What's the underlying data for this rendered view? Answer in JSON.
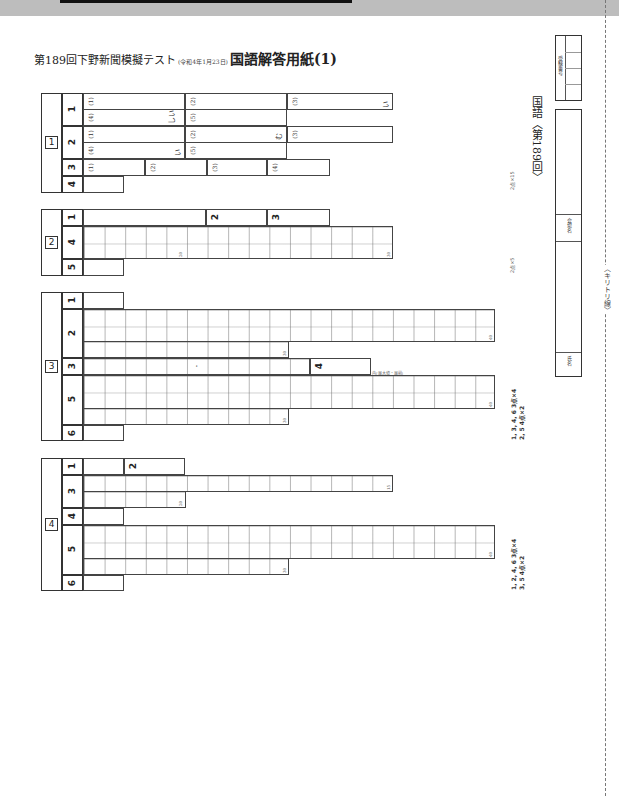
{
  "header": {
    "title_prefix": "第189回下野新聞模擬テスト",
    "title_date": "(令和4年1月23日)",
    "title_main": "国語解答用紙(1)"
  },
  "right_panel": {
    "subject": "国語〈第189回〉",
    "exam_number_label": "受験番号",
    "venue_label": "会場名",
    "name_label": "氏名",
    "cut_line_label": "〈キリトリ線〉"
  },
  "sections": [
    {
      "number": "1",
      "questions": [
        {
          "q": "1",
          "parts": [
            "(1)",
            "(2)",
            "(3)",
            "(4)",
            "(5)"
          ],
          "suffixes": {
            "(3)": "い",
            "(4)": "しい"
          }
        },
        {
          "q": "2",
          "parts": [
            "(1)",
            "(2)",
            "(3)",
            "(4)",
            "(5)"
          ],
          "suffixes": {
            "(2)": "む",
            "(4)": "い"
          }
        },
        {
          "q": "3",
          "parts": [
            "(1)",
            "(2)",
            "(3)",
            "(4)"
          ]
        },
        {
          "q": "4",
          "parts": []
        }
      ],
      "scoring": "2点×15"
    },
    {
      "number": "2",
      "questions": [
        {
          "q": "1"
        },
        {
          "q": "2"
        },
        {
          "q": "3"
        },
        {
          "q": "4",
          "grid_marks": [
            "20",
            "30"
          ]
        },
        {
          "q": "5"
        }
      ],
      "scoring": "2点×5"
    },
    {
      "number": "3",
      "questions": [
        {
          "q": "1"
        },
        {
          "q": "2",
          "grid_marks": [
            "30",
            "40"
          ]
        },
        {
          "q": "3",
          "marker": "・"
        },
        {
          "q": "4",
          "note": "内(最大値・最前)"
        },
        {
          "q": "5",
          "grid_marks": [
            "30",
            "40"
          ]
        },
        {
          "q": "6"
        }
      ],
      "scoring_lines": [
        "1, 3, 4, 6  3点×4",
        "2, 5  4点×2"
      ]
    },
    {
      "number": "4",
      "questions": [
        {
          "q": "1"
        },
        {
          "q": "2"
        },
        {
          "q": "3",
          "grid_marks": [
            "15",
            "20"
          ]
        },
        {
          "q": "4"
        },
        {
          "q": "5",
          "grid_marks": [
            "30",
            "40"
          ]
        },
        {
          "q": "6"
        }
      ],
      "scoring_lines": [
        "1, 2, 4, 6  3点×4",
        "3, 5  4点×2"
      ]
    }
  ]
}
